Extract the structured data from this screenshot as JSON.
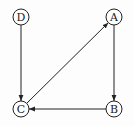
{
  "diagram": {
    "type": "directed-graph",
    "nodes": [
      {
        "id": "D",
        "label": "D",
        "x": 21,
        "y": 17
      },
      {
        "id": "A",
        "label": "A",
        "x": 114,
        "y": 17
      },
      {
        "id": "C",
        "label": "C",
        "x": 21,
        "y": 109
      },
      {
        "id": "B",
        "label": "B",
        "x": 114,
        "y": 109
      }
    ],
    "edges": [
      {
        "from": "D",
        "to": "C"
      },
      {
        "from": "A",
        "to": "B"
      },
      {
        "from": "B",
        "to": "C"
      },
      {
        "from": "C",
        "to": "A"
      }
    ]
  }
}
